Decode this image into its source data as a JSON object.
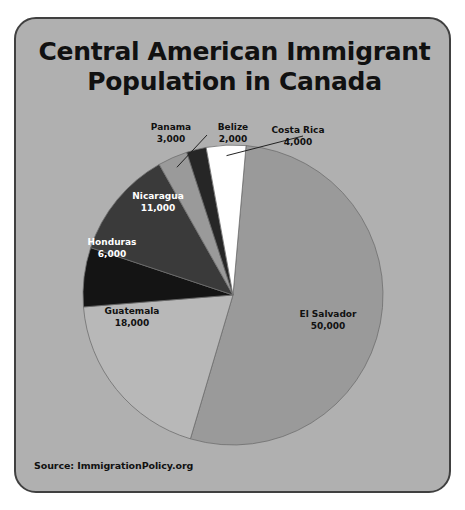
{
  "card": {
    "background_color": "#b0b0b0",
    "border_color": "#404040"
  },
  "title": {
    "line1": "Central American Immigrant",
    "line2": "Population in Canada",
    "full": "Central American Immigrant Population in Canada"
  },
  "source": {
    "text": "Source: ImmigrationPolicy.org"
  },
  "chart_data": {
    "type": "pie",
    "title": "Central American Immigrant Population in Canada",
    "xlabel": "",
    "ylabel": "",
    "total": 94000,
    "units": "people",
    "legend_position": "none",
    "grid": false,
    "labels_show_value": true,
    "categories": [
      "El Salvador",
      "Guatemala",
      "Honduras",
      "Nicaragua",
      "Panama",
      "Belize",
      "Costa Rica"
    ],
    "values": [
      50000,
      18000,
      6000,
      11000,
      3000,
      2000,
      4000
    ],
    "value_labels": [
      "50,000",
      "18,000",
      "6,000",
      "11,000",
      "3,000",
      "2,000",
      "4,000"
    ],
    "colors": [
      "#9a9a9a",
      "#b8b8b8",
      "#141414",
      "#3a3a3a",
      "#9a9a9a",
      "#262626",
      "#ffffff"
    ],
    "slices": [
      {
        "name": "El Salvador",
        "value": 50000,
        "value_label": "50,000",
        "color": "#9a9a9a",
        "label_placement": "inside",
        "label_color": "#111111"
      },
      {
        "name": "Guatemala",
        "value": 18000,
        "value_label": "18,000",
        "color": "#b8b8b8",
        "label_placement": "inside",
        "label_color": "#111111"
      },
      {
        "name": "Honduras",
        "value": 6000,
        "value_label": "6,000",
        "color": "#141414",
        "label_placement": "inside",
        "label_color": "#ffffff"
      },
      {
        "name": "Nicaragua",
        "value": 11000,
        "value_label": "11,000",
        "color": "#3a3a3a",
        "label_placement": "inside",
        "label_color": "#ffffff"
      },
      {
        "name": "Panama",
        "value": 3000,
        "value_label": "3,000",
        "color": "#9a9a9a",
        "label_placement": "outside-leader",
        "label_color": "#111111"
      },
      {
        "name": "Belize",
        "value": 2000,
        "value_label": "2,000",
        "color": "#262626",
        "label_placement": "outside",
        "label_color": "#111111"
      },
      {
        "name": "Costa Rica",
        "value": 4000,
        "value_label": "4,000",
        "color": "#ffffff",
        "label_placement": "outside-leader",
        "label_color": "#111111"
      }
    ]
  }
}
